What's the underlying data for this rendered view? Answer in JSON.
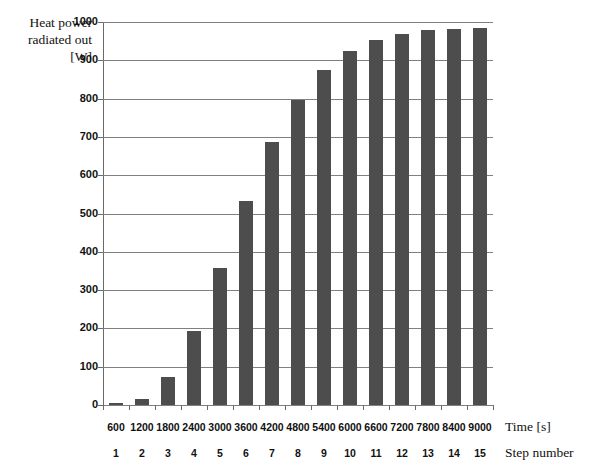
{
  "chart_data": {
    "type": "bar",
    "title": "",
    "ylabel": "Heat power radiated out [W]",
    "ylabel_lines": [
      "Heat power",
      "radiated out",
      "[W]"
    ],
    "xlabel": "Time [s]",
    "xlabel_secondary": "Step number",
    "categories": [
      "600",
      "1200",
      "1800",
      "2400",
      "3000",
      "3600",
      "4200",
      "4800",
      "5400",
      "6000",
      "6600",
      "7200",
      "7800",
      "8400",
      "9000"
    ],
    "step_numbers": [
      "1",
      "2",
      "3",
      "4",
      "5",
      "6",
      "7",
      "8",
      "9",
      "10",
      "11",
      "12",
      "13",
      "14",
      "15"
    ],
    "values": [
      5,
      16,
      72,
      193,
      357,
      533,
      688,
      797,
      874,
      925,
      953,
      969,
      979,
      983,
      985
    ],
    "ylim": [
      0,
      1000
    ],
    "yticks": [
      0,
      100,
      200,
      300,
      400,
      500,
      600,
      700,
      800,
      900,
      1000
    ],
    "ytick_labels": [
      "0",
      "100",
      "200",
      "300",
      "400",
      "500",
      "600",
      "700",
      "800",
      "900",
      "1000"
    ],
    "grid": true,
    "grid_axis": "y",
    "legend": false,
    "bar_color": "#4d4d4d",
    "grid_color": "#808080",
    "axis_color": "#6a6a6a",
    "background": "#ffffff"
  }
}
